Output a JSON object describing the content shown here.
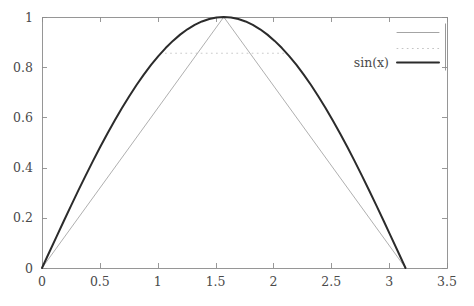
{
  "chart_data": {
    "type": "line",
    "title": "",
    "xlabel": "",
    "ylabel": "",
    "xlim": [
      0,
      3.5
    ],
    "ylim": [
      0,
      1
    ],
    "grid": false,
    "legend_position": "top-right",
    "xticks": [
      "0",
      "0.5",
      "1",
      "1.5",
      "2",
      "2.5",
      "3",
      "3.5"
    ],
    "xtick_values": [
      0,
      0.5,
      1,
      1.5,
      2,
      2.5,
      3,
      3.5
    ],
    "yticks": [
      "0",
      "0.2",
      "0.4",
      "0.6",
      "0.8",
      "1"
    ],
    "ytick_values": [
      0,
      0.2,
      0.4,
      0.6,
      0.8,
      1
    ],
    "series": [
      {
        "name": "piecewise-linear-approximation",
        "legend_label": "",
        "style": "solid-thin",
        "color": "#9a9a9a",
        "width": 0.8,
        "x": [
          0,
          1.5707963,
          3.1415927
        ],
        "values": [
          0,
          1,
          0
        ]
      },
      {
        "name": "reference-level",
        "legend_label": "",
        "style": "dotted",
        "color": "#bdbdbd",
        "width": 0.8,
        "x": [
          1.0225,
          2.1191
        ],
        "values": [
          0.8556,
          0.8556
        ]
      },
      {
        "name": "sin(x)",
        "legend_label": "sin(x)",
        "style": "solid-thick",
        "color": "#2b2b2b",
        "width": 2.0,
        "x": [
          0,
          0.0628,
          0.1257,
          0.1885,
          0.2513,
          0.3142,
          0.377,
          0.4398,
          0.5027,
          0.5655,
          0.6283,
          0.6912,
          0.754,
          0.8168,
          0.8796,
          0.9425,
          1.0053,
          1.0681,
          1.131,
          1.1938,
          1.2566,
          1.3195,
          1.3823,
          1.4451,
          1.508,
          1.5708,
          1.6336,
          1.6965,
          1.7593,
          1.8221,
          1.885,
          1.9478,
          2.0106,
          2.0735,
          2.1363,
          2.1991,
          2.2619,
          2.3248,
          2.3876,
          2.4504,
          2.5133,
          2.5761,
          2.6389,
          2.7018,
          2.7646,
          2.8274,
          2.8903,
          2.9531,
          3.0159,
          3.0788,
          3.1416
        ],
        "values": [
          0,
          0.0628,
          0.1253,
          0.1874,
          0.2487,
          0.309,
          0.3681,
          0.4258,
          0.4818,
          0.5358,
          0.5878,
          0.6374,
          0.6845,
          0.729,
          0.7705,
          0.809,
          0.8443,
          0.8763,
          0.9048,
          0.9298,
          0.9511,
          0.9686,
          0.9823,
          0.9921,
          0.998,
          1.0,
          0.998,
          0.9921,
          0.9823,
          0.9686,
          0.9511,
          0.9298,
          0.9048,
          0.8763,
          0.8443,
          0.809,
          0.7705,
          0.729,
          0.6845,
          0.6374,
          0.5878,
          0.5358,
          0.4818,
          0.4258,
          0.3681,
          0.309,
          0.2487,
          0.1874,
          0.1253,
          0.0628,
          0
        ]
      }
    ],
    "legend_entries": [
      {
        "label": "",
        "style": "solid-thin",
        "color": "#9a9a9a"
      },
      {
        "label": "",
        "style": "dotted",
        "color": "#bdbdbd"
      },
      {
        "label": "sin(x)",
        "style": "solid-thick",
        "color": "#2b2b2b"
      }
    ],
    "colors": {
      "axis": "#8c8c8c",
      "tick_text": "#4a4a4a",
      "curve_main": "#2b2b2b",
      "curve_linear": "#9a9a9a",
      "curve_dotted": "#bdbdbd",
      "background": "#ffffff"
    }
  }
}
